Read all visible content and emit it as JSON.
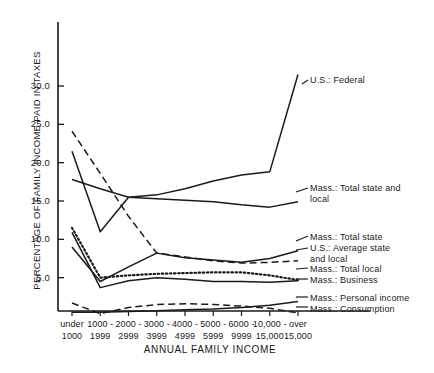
{
  "chart_data": {
    "type": "line",
    "title": "",
    "xlabel": "ANNUAL FAMILY INCOME",
    "ylabel": "PERCENTAGE OF FAMILY INCOME PAID IN TAXES",
    "categories": [
      "under 1000",
      "1000-1999",
      "2000-2999",
      "3000-3999",
      "4000-4999",
      "5000-5999",
      "6000-9999",
      "10,000-15,000",
      "over 15,000"
    ],
    "category_lines": [
      [
        "under",
        "1000"
      ],
      [
        "1000 -",
        "1999"
      ],
      [
        "2000 -",
        "2999"
      ],
      [
        "3000 -",
        "3999"
      ],
      [
        "4000 -",
        "4999"
      ],
      [
        "5000 -",
        "5999"
      ],
      [
        "6000 -",
        "9999"
      ],
      [
        "10,000 -",
        "15,000"
      ],
      [
        "over",
        "15,000"
      ]
    ],
    "ylim": [
      0,
      34
    ],
    "yticks": [
      5.0,
      10.0,
      15.0,
      20.0,
      25.0,
      30.0
    ],
    "ytick_labels": [
      "5.0",
      "10.0",
      "15.0",
      "20.0",
      "25.0",
      "30.0"
    ],
    "grid": false,
    "legend_position": "right-inline",
    "series": [
      {
        "name": "U.S.: Federal",
        "style": "solid",
        "label_lines": "U.S.: Federal",
        "values": [
          21.5,
          11.0,
          15.5,
          15.8,
          16.6,
          17.6,
          18.4,
          18.8,
          31.5
        ]
      },
      {
        "name": "Mass.: Total state and local",
        "style": "solid",
        "label_lines": "Mass.: Total state and\n          local",
        "values": [
          17.8,
          16.6,
          15.5,
          15.3,
          15.1,
          14.9,
          14.5,
          14.2,
          14.9
        ]
      },
      {
        "name": "Mass.: Total state",
        "style": "solid",
        "label_lines": "Mass.: Total state",
        "values": [
          9.0,
          4.5,
          6.4,
          8.2,
          7.6,
          7.3,
          7.0,
          7.5,
          8.5
        ]
      },
      {
        "name": "U.S.: Average state and local",
        "style": "dashed",
        "label_lines": "U.S.: Average state\n          and local",
        "values": [
          24.1,
          18.6,
          13.0,
          8.2,
          7.7,
          7.2,
          6.9,
          7.0,
          7.2
        ]
      },
      {
        "name": "Mass.: Total local",
        "style": "dotted",
        "label_lines": "Mass.: Total local",
        "values": [
          11.5,
          5.0,
          5.3,
          5.5,
          5.6,
          5.7,
          5.7,
          5.3,
          4.7
        ]
      },
      {
        "name": "Mass.: Business",
        "style": "solid",
        "label_lines": "Mass.: Business",
        "values": [
          10.9,
          3.7,
          4.6,
          5.0,
          4.8,
          4.5,
          4.5,
          4.4,
          4.6
        ]
      },
      {
        "name": "Mass.: Personal income",
        "style": "solid",
        "label_lines": "Mass.: Personal income",
        "values": [
          0.5,
          0.5,
          0.6,
          0.7,
          0.8,
          0.9,
          1.1,
          1.4,
          1.9
        ]
      },
      {
        "name": "Mass.: Consumption",
        "style": "dashed",
        "label_lines": "Mass.: Consumption",
        "values": [
          1.7,
          0.3,
          1.1,
          1.5,
          1.6,
          1.5,
          1.3,
          1.0,
          0.4
        ]
      }
    ]
  }
}
